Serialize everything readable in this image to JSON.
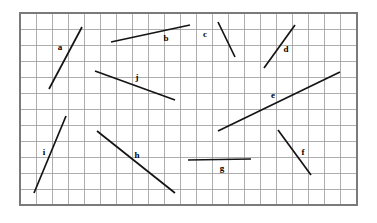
{
  "figure": {
    "canvas": {
      "width": 377,
      "height": 223
    },
    "background_color": "#ffffff",
    "grid": {
      "x0": 20,
      "y0": 13,
      "x1": 357,
      "y1": 205,
      "cols": 21,
      "rows": 12,
      "cell_width": 16.05,
      "cell_height": 16.0,
      "line_color": "#9a9a9a",
      "border_color": "#7a7a7a",
      "visible": true
    },
    "segment_color": "#141414",
    "label_color": "#000000",
    "segments": [
      {
        "id": "a",
        "label": "a",
        "x1": 49,
        "y1": 89,
        "x2": 82,
        "y2": 27,
        "label_x": 60,
        "label_y": 47
      },
      {
        "id": "b",
        "label": "b",
        "x1": 111,
        "y1": 42,
        "x2": 190,
        "y2": 25,
        "label_x": 166,
        "label_y": 38
      },
      {
        "id": "c",
        "label": "c",
        "x1": 218,
        "y1": 22,
        "x2": 235,
        "y2": 57,
        "label_x": 205,
        "label_y": 34
      },
      {
        "id": "d",
        "label": "d",
        "x1": 264,
        "y1": 68,
        "x2": 295,
        "y2": 25,
        "label_x": 286,
        "label_y": 49
      },
      {
        "id": "e",
        "label": "e",
        "x1": 218,
        "y1": 131,
        "x2": 340,
        "y2": 72,
        "label_x": 273,
        "label_y": 95
      },
      {
        "id": "f",
        "label": "f",
        "x1": 278,
        "y1": 130,
        "x2": 311,
        "y2": 175,
        "label_x": 303,
        "label_y": 152
      },
      {
        "id": "g",
        "label": "g",
        "x1": 188,
        "y1": 160,
        "x2": 251,
        "y2": 159,
        "label_x": 222,
        "label_y": 168
      },
      {
        "id": "h",
        "label": "h",
        "x1": 97,
        "y1": 131,
        "x2": 175,
        "y2": 193,
        "label_x": 137,
        "label_y": 155
      },
      {
        "id": "i",
        "label": "i",
        "x1": 34,
        "y1": 193,
        "x2": 66,
        "y2": 116,
        "label_x": 44,
        "label_y": 152
      },
      {
        "id": "j",
        "label": "j",
        "x1": 95,
        "y1": 71,
        "x2": 175,
        "y2": 100,
        "label_x": 137,
        "label_y": 77
      }
    ]
  }
}
